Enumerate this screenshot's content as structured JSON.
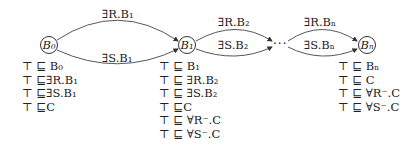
{
  "diagram": {
    "nodes": [
      {
        "id": "B0",
        "label": "B₀"
      },
      {
        "id": "B1",
        "label": "B₁"
      },
      {
        "id": "Bn",
        "label": "Bₙ"
      }
    ],
    "ellipsis": "···",
    "edges": [
      {
        "from": "B0",
        "to": "B1",
        "label": "∃R.B₁"
      },
      {
        "from": "B0",
        "to": "B1",
        "label": "∃S.B₁"
      },
      {
        "from": "B1",
        "to": "...",
        "label": "∃R.B₂"
      },
      {
        "from": "B1",
        "to": "...",
        "label": "∃S.B₂"
      },
      {
        "from": "...",
        "to": "Bn",
        "label": "∃R.Bₙ"
      },
      {
        "from": "...",
        "to": "Bn",
        "label": "∃S.Bₙ"
      }
    ],
    "axioms": {
      "B0": [
        "⊤ ⊑ B₀",
        "⊤ ⊑∃R.B₁",
        "⊤ ⊑∃S.B₁",
        "⊤ ⊑C"
      ],
      "B1": [
        "⊤ ⊑ B₁",
        "⊤ ⊑ ∃R.B₂",
        "⊤ ⊑ ∃S.B₂",
        "⊤ ⊑C",
        "⊤ ⊑ ∀R⁻.C",
        "⊤ ⊑ ∀S⁻.C"
      ],
      "Bn": [
        "⊤ ⊑ Bₙ",
        "⊤ ⊑ C",
        "⊤ ⊑ ∀R⁻.C",
        "⊤ ⊑ ∀S⁻.C"
      ]
    },
    "colors": {
      "stroke": "#333333",
      "text": "#222222"
    }
  }
}
